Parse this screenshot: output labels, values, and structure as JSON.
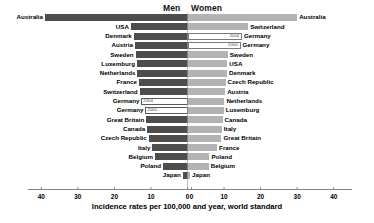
{
  "headers": {
    "men": "Men",
    "women": "Women"
  },
  "axis": {
    "title": "Incidence rates per 100,000 and year, world standard",
    "left_ticks": [
      40,
      30,
      20,
      10,
      0
    ],
    "right_ticks": [
      0,
      10,
      20,
      30,
      40
    ],
    "min": 0,
    "max": 46
  },
  "colors": {
    "men_bar": "#4d4d4d",
    "women_bar": "#b3b3b3",
    "hollow_border": "#5a5a5a",
    "axis": "#777777"
  },
  "chart_data": {
    "type": "bar",
    "title": "",
    "subtitle": "",
    "xlabel": "Incidence rates per 100,000 and year, world standard",
    "ylabel": "",
    "xlim": [
      0,
      46
    ],
    "grid": false,
    "legend": [
      "Men",
      "Women"
    ],
    "orientation": "horizontal",
    "layout": "back-to-back population pyramid",
    "men": {
      "label": "Men",
      "categories": [
        "Australia",
        "USA",
        "Denmark",
        "Austria",
        "Sweden",
        "Luxemburg",
        "Netherlands",
        "France",
        "Switzerland",
        "Germany",
        "Germany",
        "Great Britain",
        "Canada",
        "Czech Republic",
        "Italy",
        "Belgium",
        "Poland",
        "Japan"
      ],
      "values": [
        39.0,
        15.5,
        14.7,
        14.4,
        14.2,
        13.8,
        13.7,
        13.3,
        13.1,
        12.6,
        11.5,
        11.3,
        11.0,
        10.6,
        9.6,
        8.9,
        6.7,
        1.3
      ],
      "annotations": [
        null,
        null,
        null,
        null,
        null,
        null,
        null,
        null,
        null,
        "2004",
        "2000",
        null,
        null,
        null,
        null,
        null,
        null,
        null
      ]
    },
    "women": {
      "label": "Women",
      "categories": [
        "Australia",
        "Switzerland",
        "Germany",
        "Germany",
        "Sweden",
        "USA",
        "Denmark",
        "Czech Republic",
        "Austria",
        "Netherlands",
        "Luxemburg",
        "Canada",
        "Italy",
        "Great Britain",
        "France",
        "Poland",
        "Belgium",
        "Japan"
      ],
      "values": [
        30.0,
        16.6,
        14.9,
        14.5,
        11.0,
        10.9,
        10.8,
        10.4,
        10.3,
        10.1,
        9.9,
        9.6,
        9.4,
        9.3,
        8.1,
        6.0,
        5.8,
        0.7
      ],
      "annotations": [
        null,
        null,
        "2004",
        "2000",
        null,
        null,
        null,
        null,
        null,
        null,
        null,
        null,
        null,
        null,
        null,
        null,
        null,
        null
      ]
    }
  }
}
